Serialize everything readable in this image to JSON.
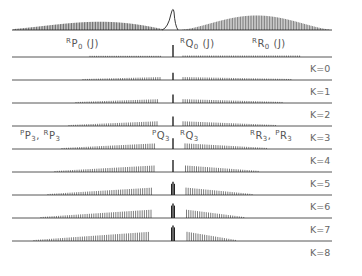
{
  "figure": {
    "type": "simulated rovibrational spectrum stack",
    "top_trace_name": "full spectrum",
    "band_labels": {
      "rp0": {
        "pre": "R",
        "main": "P",
        "sub": "0",
        "post": " (J)"
      },
      "rq0": {
        "pre": "R",
        "main": "Q",
        "sub": "0",
        "post": " (J)"
      },
      "rr0": {
        "pre": "R",
        "main": "R",
        "sub": "0",
        "post": " (J)"
      },
      "pp3_rp3": {
        "text1pre": "P",
        "text1": "P",
        "sub1": "3",
        "sep": ", ",
        "text2pre": "R",
        "text2": "P",
        "sub2": "3"
      },
      "pq3": {
        "pre": "P",
        "main": "Q",
        "sub": "3"
      },
      "rq3": {
        "pre": "R",
        "main": "Q",
        "sub": "3"
      },
      "rr3_pr3": {
        "text1pre": "R",
        "text1": "R",
        "sub1": "3",
        "sep": ", ",
        "text2pre": "P",
        "text2": "R",
        "sub2": "3"
      }
    },
    "k_labels": [
      "K=0",
      "K=1",
      "K=2",
      "K=3",
      "K=4",
      "K=5",
      "K=6",
      "K=7",
      "K=8"
    ],
    "colors": {
      "trace": "#222222",
      "baseline": "#444444",
      "label": "#555555"
    }
  }
}
